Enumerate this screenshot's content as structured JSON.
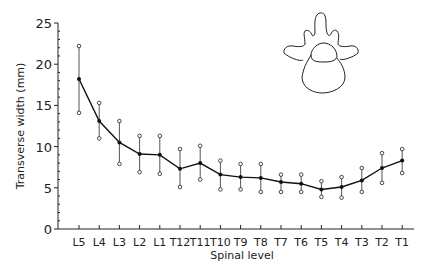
{
  "chart_data": {
    "type": "line",
    "title": "",
    "xlabel": "Spinal level",
    "ylabel": "Transverse width (mm)",
    "ylim": [
      0,
      25
    ],
    "yticks": [
      0,
      5,
      10,
      15,
      20,
      25
    ],
    "grid": false,
    "legend": null,
    "categories": [
      "L5",
      "L4",
      "L3",
      "L2",
      "L1",
      "T12",
      "T11",
      "T10",
      "T9",
      "T8",
      "T7",
      "T6",
      "T5",
      "T4",
      "T3",
      "T2",
      "T1"
    ],
    "series": [
      {
        "name": "mean",
        "values": [
          18.2,
          13.1,
          10.5,
          9.1,
          9.0,
          7.3,
          8.0,
          6.6,
          6.3,
          6.2,
          5.7,
          5.5,
          4.8,
          5.1,
          5.9,
          7.4,
          8.3
        ]
      },
      {
        "name": "upper",
        "values": [
          22.2,
          15.3,
          13.1,
          11.3,
          11.3,
          9.7,
          10.1,
          8.3,
          7.9,
          7.9,
          6.6,
          6.6,
          5.8,
          6.3,
          7.4,
          9.2,
          9.7
        ]
      },
      {
        "name": "lower",
        "values": [
          14.1,
          11.0,
          7.9,
          6.9,
          6.7,
          5.1,
          6.0,
          4.8,
          4.8,
          4.5,
          4.5,
          4.5,
          3.9,
          3.8,
          4.5,
          5.6,
          6.8
        ]
      }
    ],
    "annotations": [
      "vertebra-illustration (top right)"
    ]
  }
}
